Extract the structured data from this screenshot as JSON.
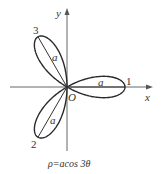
{
  "chart_data": {
    "type": "line",
    "subtype": "polar-rose",
    "title": "",
    "caption": "ρ=acos 3θ",
    "equation": "ρ = a cos 3θ",
    "xlabel": "x",
    "ylabel": "y",
    "origin_label": "O",
    "petal_count": 3,
    "petals": [
      {
        "label": "1",
        "angle_deg": 0,
        "length_label": "a"
      },
      {
        "label": "2",
        "angle_deg": 240,
        "length_label": "a"
      },
      {
        "label": "3",
        "angle_deg": 120,
        "length_label": "a"
      }
    ],
    "grid": false,
    "legend": null
  },
  "labels": {
    "x_axis": "x",
    "y_axis": "y",
    "origin": "O",
    "petal_1": "1",
    "petal_2": "2",
    "petal_3": "3",
    "radius_a_1": "a",
    "radius_a_2": "a",
    "radius_a_3": "a",
    "caption": "ρ=acos 3θ"
  },
  "colors": {
    "curve": "#2a2a2a",
    "axis": "#555555",
    "background": "#ffffff"
  }
}
